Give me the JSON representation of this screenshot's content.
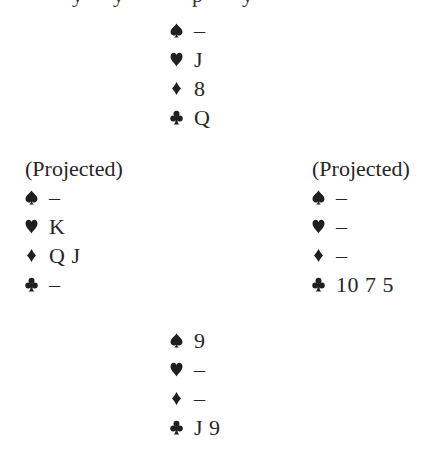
{
  "diagram": {
    "type": "bridge-deal",
    "suit_symbols": {
      "spades": "spade-icon",
      "hearts": "heart-icon",
      "diamonds": "diamond-icon",
      "clubs": "club-icon"
    },
    "north": {
      "label": "",
      "spades": "–",
      "hearts": "J",
      "diamonds": "8",
      "clubs": "Q"
    },
    "west": {
      "label": "(Projected)",
      "spades": "–",
      "hearts": "K",
      "diamonds": "Q J",
      "clubs": "–"
    },
    "east": {
      "label": "(Projected)",
      "spades": "–",
      "hearts": "–",
      "diamonds": "–",
      "clubs": "10 7 5"
    },
    "south": {
      "label": "",
      "spades": "9",
      "hearts": "–",
      "diamonds": "–",
      "clubs": "J 9"
    },
    "colors": {
      "text": "#262626",
      "background": "#ffffff"
    }
  }
}
